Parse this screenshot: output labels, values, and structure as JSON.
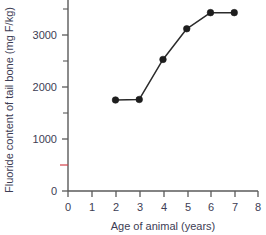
{
  "chart_data": {
    "type": "line",
    "title": "",
    "xlabel": "Age of animal (years)",
    "ylabel": "Fluoride content of tail bone (mg F/kg)",
    "x": [
      2,
      3,
      4,
      5,
      6,
      7
    ],
    "values": [
      1750,
      1760,
      2530,
      3120,
      3430,
      3430
    ],
    "series": [
      {
        "name": "Fluoride content of tail bone",
        "x": [
          2,
          3,
          4,
          5,
          6,
          7
        ],
        "values": [
          1750,
          1760,
          2530,
          3120,
          3430,
          3430
        ]
      }
    ],
    "xlim": [
      0,
      8
    ],
    "ylim": [
      0,
      3700
    ],
    "x_ticks": [
      0,
      1,
      2,
      3,
      4,
      5,
      6,
      7,
      8
    ],
    "x_tick_labels": [
      "0",
      "1",
      "2",
      "3",
      "4",
      "5",
      "6",
      "7",
      "8"
    ],
    "y_ticks": [
      0,
      1000,
      2000,
      3000
    ],
    "y_tick_labels": [
      "0",
      "1000",
      "2000",
      "3000"
    ],
    "y_minor_ticks": [
      500,
      1500,
      2500,
      3500
    ],
    "y_red_tick": 500,
    "grid": false,
    "legend": "none",
    "marker": "filled-circle",
    "line_color": "#2b2b2b",
    "marker_color": "#1d1d1d",
    "axis_color": "#5a5a5a",
    "text_color": "#3d3d54",
    "red_tick_color": "#d4424a"
  }
}
